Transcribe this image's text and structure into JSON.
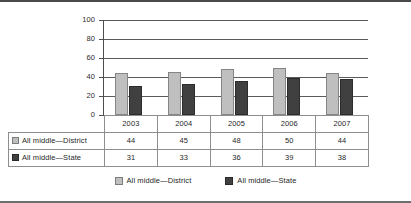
{
  "chart_data": {
    "type": "bar",
    "title": "",
    "xlabel": "",
    "ylabel": "",
    "ylim": [
      0,
      100
    ],
    "yticks": [
      0,
      20,
      40,
      60,
      80,
      100
    ],
    "ytick_labels": [
      "0",
      "20",
      "40",
      "60",
      "80",
      "100"
    ],
    "grid": true,
    "legend_position": "bottom",
    "categories": [
      "2003",
      "2004",
      "2005",
      "2006",
      "2007"
    ],
    "series": [
      {
        "name": "All middle—District",
        "values": [
          44,
          45,
          48,
          50,
          44
        ],
        "color": "#bfbfbf"
      },
      {
        "name": "All middle—State",
        "values": [
          31,
          33,
          36,
          39,
          38
        ],
        "color": "#404040"
      }
    ]
  },
  "table": {
    "header_row": [
      "",
      "2003",
      "2004",
      "2005",
      "2006",
      "2007"
    ],
    "rows": [
      {
        "label": "All middle—District",
        "swatch_color": "#bfbfbf",
        "values": [
          "44",
          "45",
          "48",
          "50",
          "44"
        ]
      },
      {
        "label": "All middle—State",
        "swatch_color": "#404040",
        "values": [
          "31",
          "33",
          "36",
          "39",
          "38"
        ]
      }
    ]
  },
  "legend": {
    "items": [
      {
        "label": "All middle—District",
        "color": "#bfbfbf"
      },
      {
        "label": "All middle—State",
        "color": "#404040"
      }
    ]
  }
}
